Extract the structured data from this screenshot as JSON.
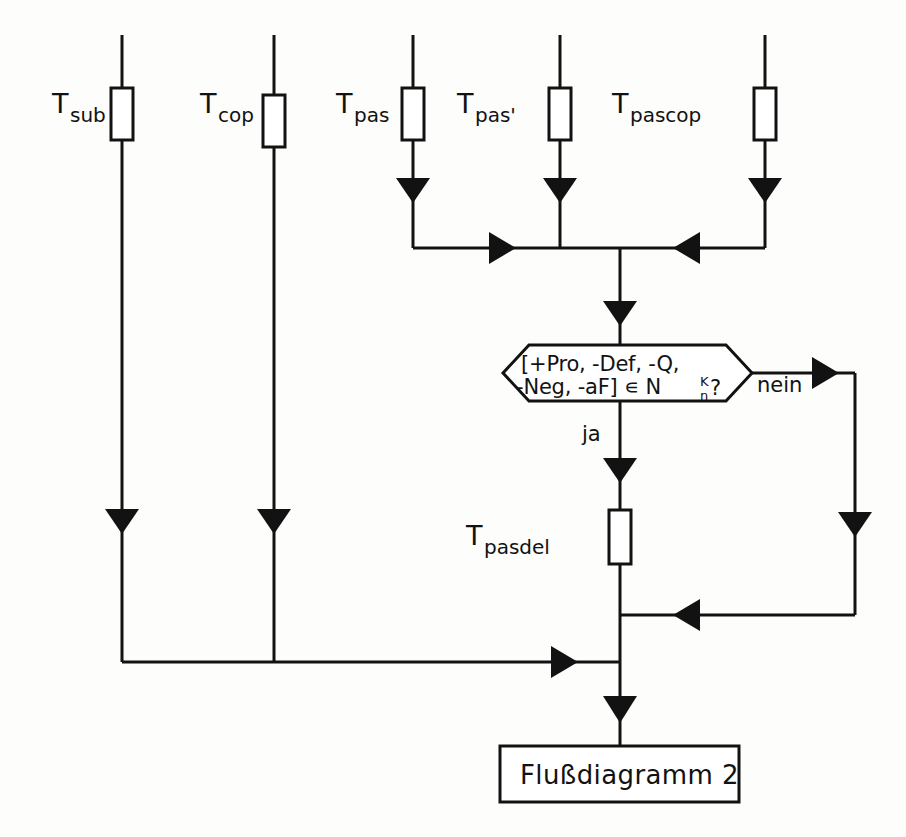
{
  "diagram": {
    "type": "flowchart",
    "language": "de",
    "colors": {
      "stroke": "#121212",
      "background": "#fdfdfb",
      "fill": "#ffffff"
    },
    "lanes": [
      {
        "id": "lane-sub",
        "label_base": "T",
        "label_subscript": "sub",
        "x": 122
      },
      {
        "id": "lane-cop",
        "label_base": "T",
        "label_subscript": "cop",
        "x": 274
      },
      {
        "id": "lane-pas",
        "label_base": "T",
        "label_subscript": "pas",
        "x": 413
      },
      {
        "id": "lane-pas-prime",
        "label_base": "T",
        "label_subscript": "pas'",
        "x": 560
      },
      {
        "id": "lane-pascop",
        "label_base": "T",
        "label_subscript": "pascop",
        "x": 765
      }
    ],
    "process_nodes": [
      {
        "id": "node-pasdel",
        "label_base": "T",
        "label_subscript": "pasdel"
      }
    ],
    "decision": {
      "id": "decision-membership",
      "line1": "[+Pro, -Def, -Q,",
      "line2_pre": "-Neg, -aF] ∊ N",
      "line2_sup": "K",
      "line2_sub": "n",
      "line2_post": "?",
      "yes_label": "ja",
      "no_label": "nein"
    },
    "terminal": {
      "id": "terminal-flussdiagramm-2",
      "label": "Flußdiagramm 2"
    }
  }
}
